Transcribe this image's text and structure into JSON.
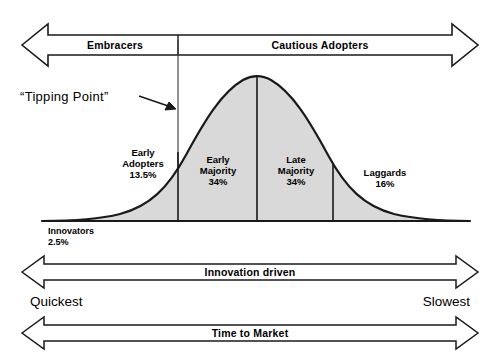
{
  "diagram": {
    "title_alt": "Technology Adoption Lifecycle Bell Curve",
    "top_bands": [
      {
        "label": "Embracers",
        "name": "band-embracers"
      },
      {
        "label": "Cautious Adopters",
        "name": "band-cautious-adopters"
      }
    ],
    "callout": {
      "label": "“Tipping Point”"
    },
    "curve_segments": [
      {
        "label": "Innovators",
        "pct": "2.5%"
      },
      {
        "label": "Early",
        "label2": "Adopters",
        "pct": "13.5%"
      },
      {
        "label": "Early",
        "label2": "Majority",
        "pct": "34%"
      },
      {
        "label": "Late",
        "label2": "Majority",
        "pct": "34%"
      },
      {
        "label": "Laggards",
        "pct": "16%"
      }
    ],
    "bottom_arrows": [
      {
        "label": "Innovation driven",
        "name": "arrow-innovation-driven"
      },
      {
        "label": "Time to Market",
        "name": "arrow-time-to-market"
      }
    ],
    "speed_labels": {
      "left": "Quickest",
      "right": "Slowest"
    },
    "colors": {
      "outline": "#1a1a1a",
      "curve_fill": "#d9d9d9",
      "background": "#ffffff"
    }
  }
}
